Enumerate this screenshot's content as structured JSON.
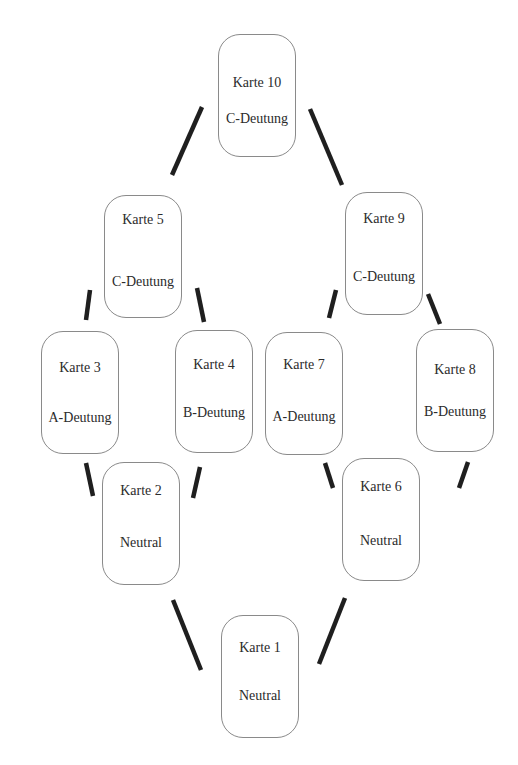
{
  "diagram": {
    "cards": {
      "card_1": {
        "title": "Karte 1",
        "label": "Neutral"
      },
      "card_2": {
        "title": "Karte 2",
        "label": "Neutral"
      },
      "card_3": {
        "title": "Karte 3",
        "label": "A-Deutung"
      },
      "card_4": {
        "title": "Karte 4",
        "label": "B-Deutung"
      },
      "card_5": {
        "title": "Karte 5",
        "label": "C-Deutung"
      },
      "card_6": {
        "title": "Karte 6",
        "label": "Neutral"
      },
      "card_7": {
        "title": "Karte 7",
        "label": "A-Deutung"
      },
      "card_8": {
        "title": "Karte 8",
        "label": "B-Deutung"
      },
      "card_9": {
        "title": "Karte 9",
        "label": "C-Deutung"
      },
      "card_10": {
        "title": "Karte 10",
        "label": "C-Deutung"
      }
    },
    "edges": [
      {
        "from": "Karte 1",
        "to": "Karte 2"
      },
      {
        "from": "Karte 1",
        "to": "Karte 6"
      },
      {
        "from": "Karte 2",
        "to": "Karte 3"
      },
      {
        "from": "Karte 2",
        "to": "Karte 4"
      },
      {
        "from": "Karte 3",
        "to": "Karte 5"
      },
      {
        "from": "Karte 4",
        "to": "Karte 5"
      },
      {
        "from": "Karte 6",
        "to": "Karte 7"
      },
      {
        "from": "Karte 6",
        "to": "Karte 8"
      },
      {
        "from": "Karte 7",
        "to": "Karte 9"
      },
      {
        "from": "Karte 8",
        "to": "Karte 9"
      },
      {
        "from": "Karte 5",
        "to": "Karte 10"
      },
      {
        "from": "Karte 9",
        "to": "Karte 10"
      }
    ],
    "colors": {
      "line": "#1f1f1f",
      "card_border": "#8a8a8a",
      "text": "#2b2b2b"
    }
  }
}
